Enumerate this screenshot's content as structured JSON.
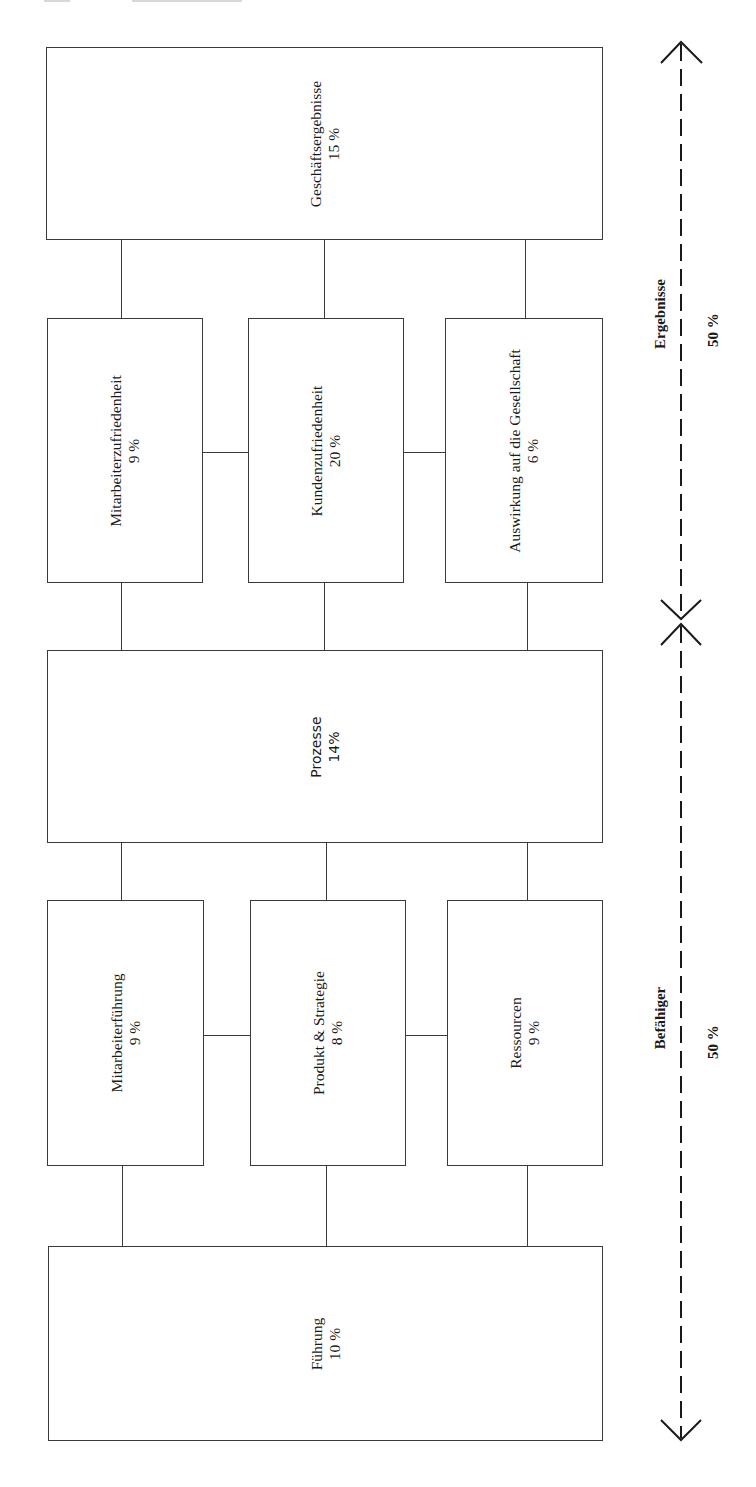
{
  "diagram": {
    "type": "EFQM-style model (rotated 90°)",
    "orientation": "rotated -90 degrees, text reads bottom-to-top",
    "boxes": {
      "geschaeftsergebnisse": {
        "name": "Geschäftsergebnisse",
        "weight": "15 %"
      },
      "mitarbeiterzufriedenheit": {
        "name": "Mitarbeiterzufriedenheit",
        "weight": "9 %"
      },
      "kundenzufriedenheit": {
        "name": "Kundenzufriedenheit",
        "weight": "20 %"
      },
      "gesellschaft": {
        "name": "Auswirkung auf die Gesellschaft",
        "weight": "6 %"
      },
      "prozesse": {
        "name": "Prozesse",
        "weight": "14%"
      },
      "mitarbeiterfuehrung": {
        "name": "Mitarbeiterführung",
        "weight": "9 %"
      },
      "produkt_strategie": {
        "name": "Produkt & Strategie",
        "weight": "8 %"
      },
      "ressourcen": {
        "name": "Ressourcen",
        "weight": "9 %"
      },
      "fuehrung": {
        "name": "Führung",
        "weight": "10 %"
      }
    },
    "axis": {
      "ergebnisse": {
        "label": "Ergebnisse",
        "weight": "50 %"
      },
      "befaehiger": {
        "label": "Befähiger",
        "weight": "50 %"
      }
    },
    "colors": {
      "line": "#3a3a3a",
      "text": "#1a1a1a",
      "background": "#ffffff"
    }
  }
}
